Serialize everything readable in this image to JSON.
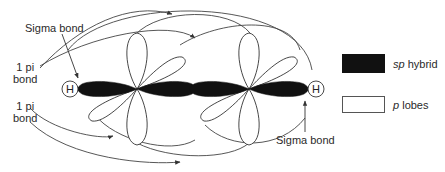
{
  "diagram": {
    "type": "orbital-diagram",
    "atoms": [
      {
        "id": "H1",
        "label": "H"
      },
      {
        "id": "C1",
        "label": ""
      },
      {
        "id": "C2",
        "label": ""
      },
      {
        "id": "H2",
        "label": "H"
      }
    ],
    "labels": {
      "sigma_bond_top": "Sigma bond",
      "pi_bond_1_line1": "1 pi",
      "pi_bond_1_line2": "bond",
      "pi_bond_2_line1": "1 pi",
      "pi_bond_2_line2": "bond",
      "sigma_bond_bottom": "Sigma bond"
    },
    "legend": [
      {
        "swatch": "filled",
        "color": "#111111",
        "label_italic": "sp",
        "label_rest": " hybrid"
      },
      {
        "swatch": "outline",
        "color": "#ffffff",
        "label_italic": "p",
        "label_rest": " lobes"
      }
    ],
    "colors": {
      "sp_hybrid": "#111111",
      "p_lobe_fill": "#ffffff",
      "line": "#333333"
    }
  }
}
